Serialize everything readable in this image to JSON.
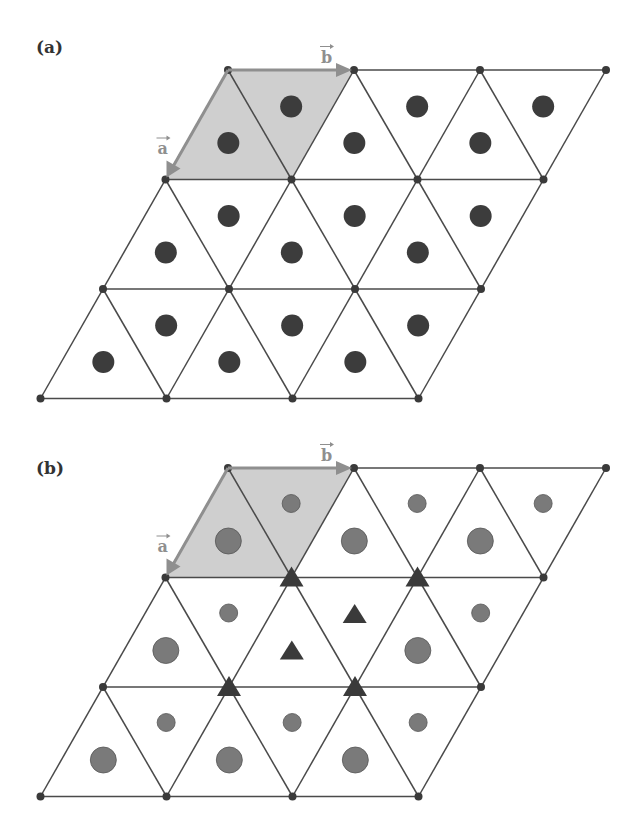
{
  "figure": {
    "colors": {
      "line": "#4a4a4a",
      "node": "#3a3a3a",
      "shade": "#cfcfcf",
      "vector": "#8f8f8f",
      "dot_a": "#3c3c3c",
      "dot_b": "#7a7a7a",
      "triangle_marker": "#3a3a3a"
    },
    "panels": [
      {
        "id": "a",
        "label": "(a)",
        "label_pos": [
          36,
          53
        ],
        "origin_y": 70,
        "vectors": {
          "a_label": "a",
          "b_label": "b"
        },
        "marker_mode": "uniform",
        "dot_radius": 11
      },
      {
        "id": "b",
        "label": "(b)",
        "label_pos": [
          36,
          474
        ],
        "origin_y": 468,
        "vectors": {
          "a_label": "a",
          "b_label": "b"
        },
        "marker_mode": "decorated",
        "large_radius": 13,
        "small_radius": 9
      }
    ],
    "lattice": {
      "top_left_x": 228,
      "cell_width": 126,
      "row_height": 109.5,
      "row_shift": -62.5,
      "rows": 3,
      "cols": 3
    }
  }
}
